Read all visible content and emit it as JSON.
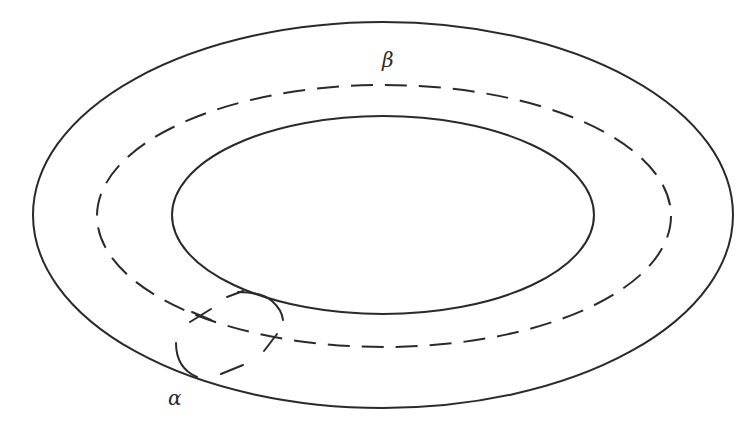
{
  "figure": {
    "type": "torus-cross-section-diagram",
    "labels": {
      "beta": "β",
      "alpha": "α"
    },
    "colors": {
      "stroke": "#2a2a2a",
      "background": "#ffffff"
    },
    "shapes": {
      "outer_ellipse": {
        "cx": 383,
        "cy": 215,
        "rx": 350,
        "ry": 193,
        "style": "solid"
      },
      "inner_ellipse": {
        "cx": 383,
        "cy": 215,
        "rx": 211,
        "ry": 99,
        "style": "solid"
      },
      "beta_curve": {
        "cx": 384,
        "cy": 216,
        "rx": 287,
        "ry": 131,
        "style": "dashed"
      },
      "alpha_curve": {
        "style": "solid-front, dashed-back",
        "crossing_mark": "+"
      }
    }
  }
}
